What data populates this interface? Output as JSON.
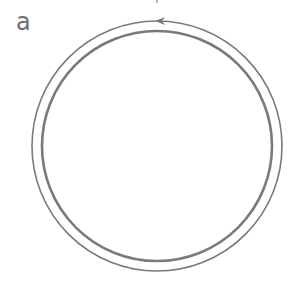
{
  "figure": {
    "panel_label": "a",
    "colors": {
      "stroke": "#7a7a7a",
      "background": "#ffffff",
      "label": "#6e6e6e"
    },
    "outer_circle": {
      "cx": 157,
      "cy": 146,
      "r": 125,
      "stroke_width": 1.6
    },
    "inner_circle": {
      "cx": 157,
      "cy": 146,
      "r": 115,
      "stroke_width": 2.6
    },
    "arrow": {
      "position": "top of outer circle",
      "direction": "counterclockwise"
    }
  }
}
